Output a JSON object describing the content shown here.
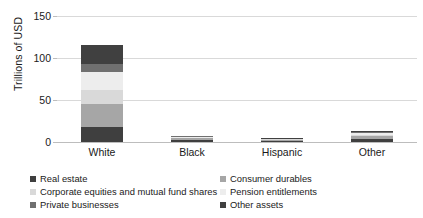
{
  "chart_data": {
    "type": "bar",
    "stacked": true,
    "title": "",
    "xlabel": "",
    "ylabel": "Trillions of USD",
    "ylim": [
      0,
      150
    ],
    "yticks": [
      0,
      50,
      100,
      150
    ],
    "grid": true,
    "legend_position": "bottom",
    "categories": [
      "White",
      "Black",
      "Hispanic",
      "Other"
    ],
    "series": [
      {
        "name": "Real estate",
        "color": "#3f3f3f",
        "values": [
          18.0,
          2.2,
          1.5,
          3.6
        ]
      },
      {
        "name": "Consumer durables",
        "color": "#a6a6a6",
        "values": [
          27.0,
          2.3,
          1.2,
          3.3
        ]
      },
      {
        "name": "Corporate equities and mutual fund shares",
        "color": "#d9d9d9",
        "values": [
          17.0,
          0.8,
          0.4,
          1.9
        ]
      },
      {
        "name": "Pension entitlements",
        "color": "#ededed",
        "values": [
          21.0,
          0.9,
          0.5,
          1.7
        ]
      },
      {
        "name": "Private businesses",
        "color": "#707070",
        "values": [
          10.0,
          0.5,
          0.3,
          1.3
        ]
      },
      {
        "name": "Other assets",
        "color": "#404040",
        "values": [
          22.0,
          0.8,
          0.6,
          1.7
        ]
      }
    ],
    "totals": [
      115.0,
      7.5,
      4.5,
      13.5
    ]
  },
  "axis": {
    "y_title": "Trillions of USD",
    "y_tick_labels": [
      "0",
      "50",
      "100",
      "150"
    ]
  },
  "legend": {
    "items": [
      {
        "label": "Real estate",
        "color": "#3f3f3f"
      },
      {
        "label": "Consumer durables",
        "color": "#a6a6a6"
      },
      {
        "label": "Corporate equities and mutual fund shares",
        "color": "#d9d9d9"
      },
      {
        "label": "Pension entitlements",
        "color": "#ededed"
      },
      {
        "label": "Private businesses",
        "color": "#707070"
      },
      {
        "label": "Other assets",
        "color": "#404040"
      }
    ]
  },
  "style": {
    "gridline_color": "#d9d9d9",
    "axis_color": "#bdbdbd",
    "text_color": "#1a1a1a",
    "background": "#ffffff"
  }
}
